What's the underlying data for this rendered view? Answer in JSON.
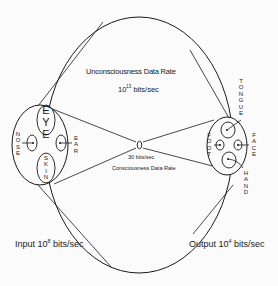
{
  "diagram": {
    "unconsciousness": {
      "title": "Unconsciousness Data Rate",
      "rate_base": "10",
      "rate_exp": "13",
      "rate_unit": " bits/sec"
    },
    "consciousness": {
      "title": "Consciousness Data Rate",
      "rate": "30 bits/sec"
    },
    "input": {
      "prefix": "Input 10",
      "exp": "8",
      "unit": " bits/sec"
    },
    "output": {
      "prefix": "Output 10",
      "exp": "4",
      "unit": " bits/sec"
    },
    "input_senses": {
      "eye": "EYE",
      "skin": "SKIN",
      "nose": "NOSE",
      "ear": "EAR"
    },
    "output_organs": {
      "tongue": "TONGUE",
      "foot": "FOOT",
      "face": "FACE",
      "hand": "HAND"
    },
    "colors": {
      "line": "#1a1a1a",
      "background": "#fbfbfb"
    }
  }
}
